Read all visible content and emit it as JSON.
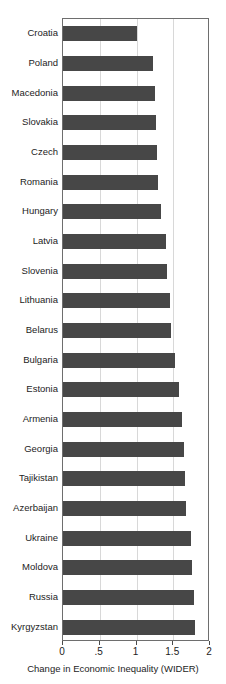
{
  "chart_data": {
    "type": "bar",
    "orientation": "horizontal",
    "title": "",
    "xlabel": "Change in Economic Inequality (WIDER)",
    "ylabel": "",
    "xlim": [
      0,
      2
    ],
    "xticks": [
      0,
      0.5,
      1,
      1.5,
      2
    ],
    "xtick_labels": [
      "0",
      ".5",
      "1",
      "1.5",
      "2"
    ],
    "grid": true,
    "grid_axis": "x",
    "legend": "none",
    "bar_color": "#474747",
    "categories": [
      "Croatia",
      "Poland",
      "Macedonia",
      "Slovakia",
      "Czech",
      "Romania",
      "Hungary",
      "Latvia",
      "Slovenia",
      "Lithuania",
      "Belarus",
      "Bulgaria",
      "Estonia",
      "Armenia",
      "Georgia",
      "Tajikistan",
      "Azerbaijan",
      "Ukraine",
      "Moldova",
      "Russia",
      "Kyrgyzstan"
    ],
    "values": [
      1.0,
      1.22,
      1.25,
      1.27,
      1.28,
      1.29,
      1.33,
      1.4,
      1.42,
      1.45,
      1.47,
      1.52,
      1.58,
      1.62,
      1.64,
      1.66,
      1.67,
      1.74,
      1.76,
      1.78,
      1.79
    ]
  }
}
